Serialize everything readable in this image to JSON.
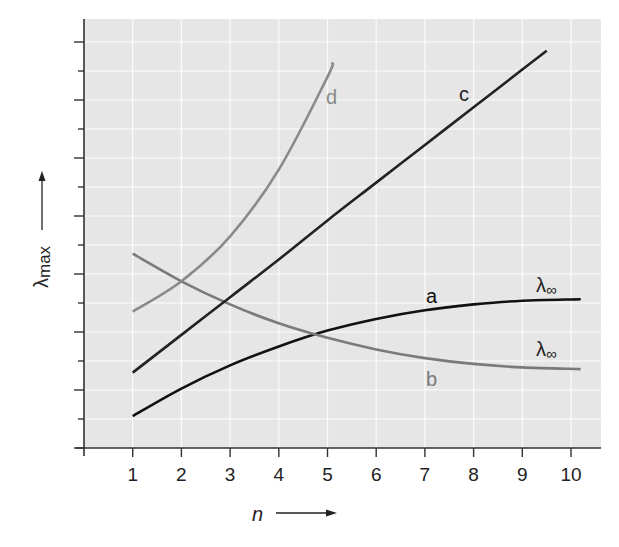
{
  "chart_data": {
    "type": "line",
    "title": "",
    "xlabel": "n",
    "ylabel": "λmax",
    "xlim": [
      0,
      10.4
    ],
    "ylim": [
      0,
      14
    ],
    "x_ticks": [
      1,
      2,
      3,
      4,
      5,
      6,
      7,
      8,
      9,
      10
    ],
    "y_ticks_unlabeled": true,
    "y_tick_count": 14,
    "grid": true,
    "legend": "none (curves labeled inline)",
    "series": [
      {
        "name": "a",
        "color": "#111111",
        "asymptote_label": "λ∞",
        "x": [
          1,
          2,
          3,
          4,
          5,
          6,
          7,
          8,
          9,
          10.2
        ],
        "values": [
          1.1,
          2.05,
          2.85,
          3.5,
          4.05,
          4.45,
          4.75,
          4.95,
          5.08,
          5.13
        ]
      },
      {
        "name": "b",
        "color": "#7a7a7a",
        "asymptote_label": "λ∞",
        "x": [
          1,
          2,
          3,
          4,
          5,
          6,
          7,
          8,
          9,
          10.2
        ],
        "values": [
          6.7,
          5.75,
          4.95,
          4.3,
          3.8,
          3.4,
          3.1,
          2.9,
          2.78,
          2.72
        ]
      },
      {
        "name": "c",
        "color": "#222222",
        "x": [
          1,
          2,
          3,
          4,
          5,
          6,
          7,
          8,
          9,
          9.5
        ],
        "values": [
          2.6,
          3.9,
          5.2,
          6.5,
          7.85,
          9.15,
          10.45,
          11.75,
          13.05,
          13.7
        ]
      },
      {
        "name": "d",
        "color": "#8a8a8a",
        "x": [
          1,
          2,
          3,
          4,
          5,
          5.1
        ],
        "values": [
          4.7,
          5.75,
          7.3,
          9.6,
          12.8,
          13.3
        ]
      }
    ],
    "annotations": [
      "a",
      "b",
      "c",
      "d",
      "λ∞",
      "λ∞"
    ]
  },
  "labels": {
    "x_axis_title": "n",
    "y_axis_title_main": "λ",
    "y_axis_title_sub": "max",
    "curve_a": "a",
    "curve_b": "b",
    "curve_c": "c",
    "curve_d": "d",
    "lambda_inf_a": "λ",
    "lambda_inf_b": "λ",
    "inf_sub": "∞",
    "x_tick_labels": [
      "1",
      "2",
      "3",
      "4",
      "5",
      "6",
      "7",
      "8",
      "9",
      "10"
    ]
  },
  "colors": {
    "plot_background": "#e6e6e6",
    "grid": "#fbfbfb",
    "axis": "#333333"
  }
}
